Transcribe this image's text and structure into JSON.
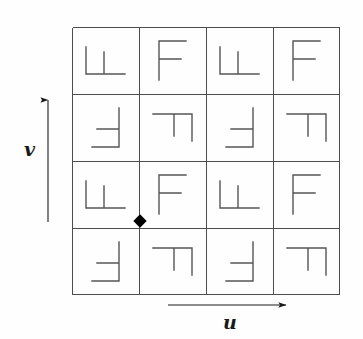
{
  "figure": {
    "background_color": "#fefefe",
    "line_color": "#555555",
    "grid_line_color": "#4d4d4d",
    "axis_color": "#1a1a1a",
    "marker_color": "#000000"
  },
  "grid": {
    "rows": 4,
    "columns": 4,
    "cell_size_px": 67,
    "origin_px": {
      "x": 72,
      "y": 27
    },
    "total_size_px": 268,
    "stroke_width": 1
  },
  "axes": {
    "horizontal": {
      "label": "u",
      "direction": "right",
      "arrow": "right-arrow-icon",
      "start_px": {
        "x": 168,
        "y": 305
      },
      "end_px": {
        "x": 290,
        "y": 305
      }
    },
    "vertical": {
      "label": "v",
      "direction": "up",
      "arrow": "up-arrow-icon",
      "start_px": {
        "x": 48,
        "y": 222
      },
      "end_px": {
        "x": 48,
        "y": 96
      }
    }
  },
  "origin_marker": {
    "shape": "diamond",
    "label": "lattice-origin-marker",
    "color": "#000000",
    "position_px": {
      "x": 140,
      "y": 221
    },
    "grid_position": {
      "row_boundary": 3,
      "column_boundary": 1
    }
  },
  "motifs": {
    "glyph": "F",
    "description": "Each cell contains the letter F at one of four rotations",
    "rotations_legend": [
      {
        "code": 0,
        "name": "upright"
      },
      {
        "code": 90,
        "name": "rotated-90-clockwise"
      },
      {
        "code": 180,
        "name": "rotated-180"
      },
      {
        "code": 270,
        "name": "rotated-270-clockwise"
      }
    ],
    "cells": [
      {
        "row": 1,
        "col": 1,
        "rotation": 270,
        "name": "motif-r1c1"
      },
      {
        "row": 1,
        "col": 2,
        "rotation": 0,
        "name": "motif-r1c2"
      },
      {
        "row": 1,
        "col": 3,
        "rotation": 270,
        "name": "motif-r1c3"
      },
      {
        "row": 1,
        "col": 4,
        "rotation": 0,
        "name": "motif-r1c4"
      },
      {
        "row": 2,
        "col": 1,
        "rotation": 180,
        "name": "motif-r2c1"
      },
      {
        "row": 2,
        "col": 2,
        "rotation": 90,
        "name": "motif-r2c2"
      },
      {
        "row": 2,
        "col": 3,
        "rotation": 180,
        "name": "motif-r2c3"
      },
      {
        "row": 2,
        "col": 4,
        "rotation": 90,
        "name": "motif-r2c4"
      },
      {
        "row": 3,
        "col": 1,
        "rotation": 270,
        "name": "motif-r3c1"
      },
      {
        "row": 3,
        "col": 2,
        "rotation": 0,
        "name": "motif-r3c2"
      },
      {
        "row": 3,
        "col": 3,
        "rotation": 270,
        "name": "motif-r3c3"
      },
      {
        "row": 3,
        "col": 4,
        "rotation": 0,
        "name": "motif-r3c4"
      },
      {
        "row": 4,
        "col": 1,
        "rotation": 180,
        "name": "motif-r4c1"
      },
      {
        "row": 4,
        "col": 2,
        "rotation": 90,
        "name": "motif-r4c2"
      },
      {
        "row": 4,
        "col": 3,
        "rotation": 180,
        "name": "motif-r4c3"
      },
      {
        "row": 4,
        "col": 4,
        "rotation": 90,
        "name": "motif-r4c4"
      }
    ]
  }
}
